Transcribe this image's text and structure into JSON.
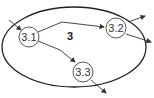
{
  "diagram": {
    "container": {
      "label": "3"
    },
    "nodes": [
      {
        "id": "n31",
        "label": "3.1"
      },
      {
        "id": "n32",
        "label": "3.2"
      },
      {
        "id": "n33",
        "label": "3.3"
      }
    ],
    "edges": [
      {
        "from": "external",
        "to": "3.1"
      },
      {
        "from": "3.1",
        "to": "3.2"
      },
      {
        "from": "3.1",
        "to": "3.3"
      },
      {
        "from": "3.2",
        "to": "external"
      },
      {
        "from": "3.2",
        "to": "external"
      },
      {
        "from": "3.3",
        "to": "external"
      }
    ],
    "colors": {
      "stroke": "#333333",
      "background": "#ffffff"
    }
  }
}
